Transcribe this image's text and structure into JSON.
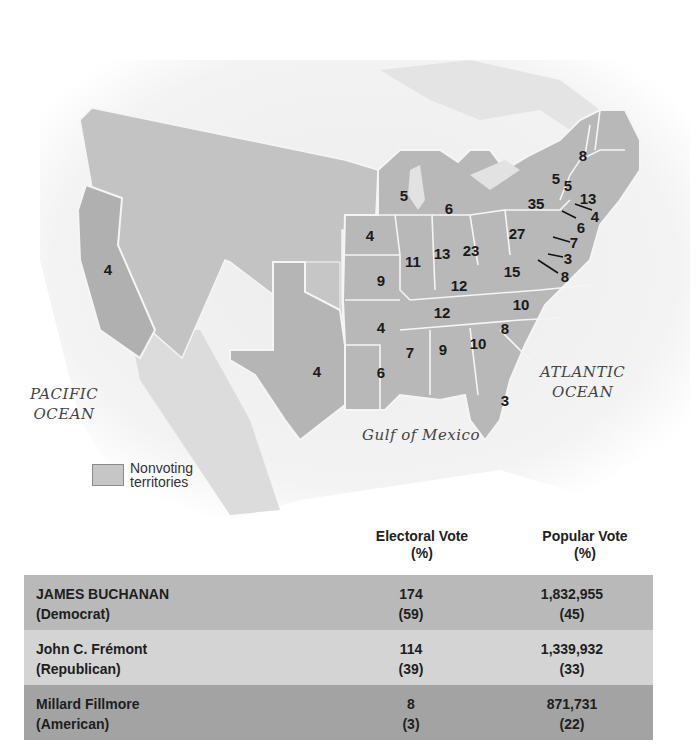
{
  "map": {
    "oceans": {
      "pacific": [
        "PACIFIC",
        "OCEAN"
      ],
      "atlantic": [
        "ATLANTIC",
        "OCEAN"
      ],
      "gulf": "Gulf of Mexico"
    },
    "legend": {
      "label_line1": "Nonvoting",
      "label_line2": "territories",
      "color": "#c6c6c6"
    },
    "state_votes": [
      {
        "state": "California",
        "votes": "4"
      },
      {
        "state": "Texas",
        "votes": "4"
      },
      {
        "state": "Iowa",
        "votes": "4"
      },
      {
        "state": "Missouri",
        "votes": "9"
      },
      {
        "state": "Arkansas",
        "votes": "4"
      },
      {
        "state": "Louisiana",
        "votes": "6"
      },
      {
        "state": "Wisconsin",
        "votes": "5"
      },
      {
        "state": "Michigan",
        "votes": "6"
      },
      {
        "state": "Illinois",
        "votes": "11"
      },
      {
        "state": "Indiana",
        "votes": "13"
      },
      {
        "state": "Ohio",
        "votes": "23"
      },
      {
        "state": "Kentucky",
        "votes": "12"
      },
      {
        "state": "Tennessee",
        "votes": "12"
      },
      {
        "state": "Mississippi",
        "votes": "7"
      },
      {
        "state": "Alabama",
        "votes": "9"
      },
      {
        "state": "Georgia",
        "votes": "10"
      },
      {
        "state": "South Carolina",
        "votes": "8"
      },
      {
        "state": "North Carolina",
        "votes": "10"
      },
      {
        "state": "Virginia",
        "votes": "15"
      },
      {
        "state": "Florida",
        "votes": "3"
      },
      {
        "state": "Pennsylvania",
        "votes": "27"
      },
      {
        "state": "New York",
        "votes": "35"
      },
      {
        "state": "Vermont",
        "votes": "5"
      },
      {
        "state": "New Hampshire",
        "votes": "5"
      },
      {
        "state": "Maine",
        "votes": "8"
      },
      {
        "state": "Massachusetts",
        "votes": "13"
      },
      {
        "state": "Rhode Island",
        "votes": "4"
      },
      {
        "state": "Connecticut",
        "votes": "6"
      },
      {
        "state": "New Jersey",
        "votes": "7"
      },
      {
        "state": "Delaware",
        "votes": "3"
      },
      {
        "state": "Maryland",
        "votes": "8"
      }
    ]
  },
  "table": {
    "headers": {
      "electoral": [
        "Electoral Vote",
        "(%)"
      ],
      "popular": [
        "Popular Vote",
        "(%)"
      ]
    },
    "rows": [
      {
        "name": "JAMES BUCHANAN",
        "party": "(Democrat)",
        "electoral": "174",
        "electoral_pct": "(59)",
        "popular": "1,832,955",
        "popular_pct": "(45)",
        "color": "#b9b9b9"
      },
      {
        "name": "John C. Frémont",
        "party": "(Republican)",
        "electoral": "114",
        "electoral_pct": "(39)",
        "popular": "1,339,932",
        "popular_pct": "(33)",
        "color": "#d4d4d4"
      },
      {
        "name": "Millard Fillmore",
        "party": "(American)",
        "electoral": "8",
        "electoral_pct": "(3)",
        "popular": "871,731",
        "popular_pct": "(22)",
        "color": "#a3a3a3"
      }
    ]
  }
}
